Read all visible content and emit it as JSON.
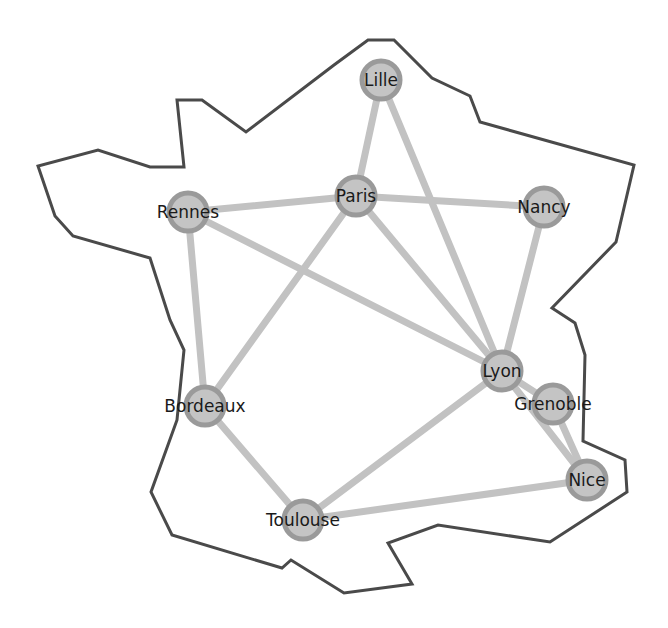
{
  "diagram": {
    "type": "network-graph-over-map",
    "colors": {
      "outline": "#4a4a4a",
      "edge": "#c2c2c2",
      "node_fill": "#c4c4c4",
      "node_stroke": "#9a9a9a",
      "label": "#1a1a1a",
      "background": "#ffffff"
    },
    "outline_points": [
      [
        368,
        40
      ],
      [
        394,
        40
      ],
      [
        432,
        78
      ],
      [
        470,
        96
      ],
      [
        480,
        122
      ],
      [
        634,
        165
      ],
      [
        616,
        242
      ],
      [
        552,
        308
      ],
      [
        575,
        323
      ],
      [
        585,
        355
      ],
      [
        583,
        441
      ],
      [
        625,
        460
      ],
      [
        627,
        492
      ],
      [
        550,
        542
      ],
      [
        438,
        525
      ],
      [
        388,
        543
      ],
      [
        412,
        584
      ],
      [
        344,
        593
      ],
      [
        291,
        560
      ],
      [
        282,
        568
      ],
      [
        172,
        535
      ],
      [
        151,
        492
      ],
      [
        177,
        420
      ],
      [
        184,
        350
      ],
      [
        170,
        320
      ],
      [
        150,
        258
      ],
      [
        73,
        236
      ],
      [
        55,
        216
      ],
      [
        38,
        166
      ],
      [
        98,
        150
      ],
      [
        150,
        167
      ],
      [
        184,
        167
      ],
      [
        177,
        100
      ],
      [
        202,
        100
      ],
      [
        246,
        132
      ],
      [
        334,
        65
      ]
    ],
    "nodes": [
      {
        "id": "lille",
        "label": "Lille",
        "x": 381,
        "y": 80
      },
      {
        "id": "paris",
        "label": "Paris",
        "x": 356,
        "y": 196
      },
      {
        "id": "nancy",
        "label": "Nancy",
        "x": 544,
        "y": 207
      },
      {
        "id": "rennes",
        "label": "Rennes",
        "x": 188,
        "y": 212
      },
      {
        "id": "lyon",
        "label": "Lyon",
        "x": 502,
        "y": 371
      },
      {
        "id": "grenoble",
        "label": "Grenoble",
        "x": 553,
        "y": 404
      },
      {
        "id": "bordeaux",
        "label": "Bordeaux",
        "x": 205,
        "y": 406
      },
      {
        "id": "nice",
        "label": "Nice",
        "x": 587,
        "y": 480
      },
      {
        "id": "toulouse",
        "label": "Toulouse",
        "x": 303,
        "y": 520
      }
    ],
    "edges": [
      [
        "lille",
        "paris"
      ],
      [
        "lille",
        "lyon"
      ],
      [
        "paris",
        "rennes"
      ],
      [
        "paris",
        "nancy"
      ],
      [
        "paris",
        "bordeaux"
      ],
      [
        "paris",
        "lyon"
      ],
      [
        "rennes",
        "bordeaux"
      ],
      [
        "rennes",
        "lyon"
      ],
      [
        "nancy",
        "lyon"
      ],
      [
        "lyon",
        "grenoble"
      ],
      [
        "lyon",
        "nice"
      ],
      [
        "lyon",
        "toulouse"
      ],
      [
        "grenoble",
        "nice"
      ],
      [
        "bordeaux",
        "toulouse"
      ],
      [
        "toulouse",
        "nice"
      ]
    ],
    "node_radius": 19
  }
}
